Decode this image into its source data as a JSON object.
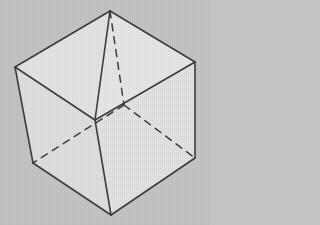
{
  "figure": {
    "type": "line-drawing",
    "canvas": {
      "width": 210,
      "height": 225
    },
    "background_color": "#c3c3c3",
    "stroke_color": "#3b3b3b",
    "stroke_width": 1.6,
    "hidden_stroke_width": 1.5,
    "hidden_dash_pattern": "7 6",
    "vertices": {
      "top": {
        "label": "top",
        "x": 110,
        "y": 11
      },
      "left": {
        "label": "left",
        "x": 15,
        "y": 67
      },
      "right": {
        "label": "right",
        "x": 195,
        "y": 62
      },
      "front_center": {
        "label": "front-center",
        "x": 95,
        "y": 120
      },
      "bottom_left": {
        "label": "bottom-left",
        "x": 33,
        "y": 163
      },
      "bottom_right": {
        "label": "bottom-right",
        "x": 195,
        "y": 158
      },
      "bottom": {
        "label": "bottom",
        "x": 111,
        "y": 215
      },
      "hidden_back": {
        "label": "hidden-back",
        "x": 124,
        "y": 105
      }
    },
    "faces": [
      {
        "name": "top-left-face",
        "fill": "#e3e3e3",
        "points": "15,67 110,11 95,120"
      },
      {
        "name": "top-right-face",
        "fill": "#e6e6e6",
        "points": "110,11 195,62 95,120"
      },
      {
        "name": "left-face",
        "fill": "#dedede",
        "points": "15,67 95,120 111,215 33,163"
      },
      {
        "name": "right-face",
        "fill": "#e1e1e1",
        "points": "95,120 195,62 195,158 111,215"
      }
    ],
    "solid_edges": [
      {
        "name": "edge-left-to-top",
        "from": "left",
        "to": "top"
      },
      {
        "name": "edge-top-to-right",
        "from": "top",
        "to": "right"
      },
      {
        "name": "edge-left-to-center",
        "from": "left",
        "to": "front_center"
      },
      {
        "name": "edge-right-to-center",
        "from": "right",
        "to": "front_center"
      },
      {
        "name": "edge-top-to-center",
        "from": "top",
        "to": "front_center"
      },
      {
        "name": "edge-left-to-bottom-left",
        "from": "left",
        "to": "bottom_left"
      },
      {
        "name": "edge-right-to-bottom-right",
        "from": "right",
        "to": "bottom_right"
      },
      {
        "name": "edge-center-to-bottom",
        "from": "front_center",
        "to": "bottom"
      },
      {
        "name": "edge-bottom-left-to-bottom",
        "from": "bottom_left",
        "to": "bottom"
      },
      {
        "name": "edge-bottom-to-bottom-right",
        "from": "bottom",
        "to": "bottom_right"
      }
    ],
    "hidden_edges": [
      {
        "name": "hidden-edge-top-to-back",
        "from": "top",
        "to": "hidden_back"
      },
      {
        "name": "hidden-edge-back-to-bottom-left",
        "from": "hidden_back",
        "to": "bottom_left"
      },
      {
        "name": "hidden-edge-back-to-bottom-right",
        "from": "hidden_back",
        "to": "bottom_right"
      }
    ]
  }
}
